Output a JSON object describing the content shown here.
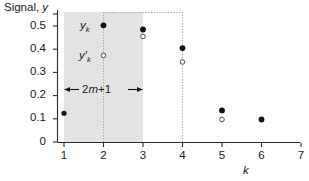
{
  "chart_data": {
    "type": "scatter",
    "title": "",
    "ylabel": "Signal, y",
    "xlabel": "k",
    "xlim": [
      0.45,
      7.35
    ],
    "ylim": [
      0,
      0.565
    ],
    "grid": false,
    "legend_position": "inline-annotation",
    "x": [
      1,
      2,
      3,
      4,
      5,
      6
    ],
    "xticklabels": [
      "1",
      "2",
      "3",
      "4",
      "5",
      "6",
      "7"
    ],
    "xtickvalues": [
      1,
      2,
      3,
      4,
      5,
      6,
      7
    ],
    "yticklabels": [
      "0",
      "0.1",
      "0.2",
      "0.3",
      "0.4",
      "0.5"
    ],
    "ytickvalues": [
      0,
      0.1,
      0.2,
      0.3,
      0.4,
      0.5
    ],
    "series": [
      {
        "name": "y_k",
        "marker": "filled-circle",
        "x": [
          1,
          2,
          3,
          4,
          5,
          6
        ],
        "values": [
          0.124,
          0.503,
          0.485,
          0.405,
          0.136,
          0.097
        ]
      },
      {
        "name": "y'_k",
        "marker": "open-circle",
        "x": [
          2,
          3,
          4,
          5
        ],
        "values": [
          0.373,
          0.455,
          0.345,
          0.097
        ]
      }
    ],
    "shaded_band": {
      "x_start": 1,
      "x_end": 3,
      "color": "#e3e3e3"
    },
    "reference_lines": [
      {
        "orientation": "vertical",
        "x": 2,
        "style": "dotted"
      },
      {
        "orientation": "vertical",
        "x": 4,
        "style": "dotted"
      },
      {
        "orientation": "horizontal",
        "y": 0.553,
        "x_start": 2,
        "x_end": 4,
        "style": "dotted"
      }
    ],
    "annotations": [
      {
        "text": "2m+1",
        "x": 2,
        "y": 0.228,
        "style": "double-headed-arrow",
        "span_x": [
          1,
          3
        ]
      },
      {
        "text": "y_k",
        "x": 1.7,
        "y": 0.503
      },
      {
        "text": "y'_k",
        "x": 1.7,
        "y": 0.373
      }
    ]
  },
  "axes": {
    "y_title_prefix": "Signal, ",
    "y_title_var": "y",
    "x_title": "k",
    "y_ticks": [
      "0.5",
      "0.4",
      "0.3",
      "0.2",
      "0.1",
      "0"
    ],
    "x_ticks": [
      "1",
      "2",
      "3",
      "4",
      "5",
      "6",
      "7"
    ]
  },
  "labels": {
    "series_raw_base": "y",
    "series_raw_sub": "k",
    "series_smooth_base": "y′",
    "series_smooth_sub": "k",
    "window_annotation_a": "2",
    "window_annotation_m": "m",
    "window_annotation_b": "+1"
  },
  "colors": {
    "band": "#e3e3e3",
    "axis": "#2b2b2b",
    "filled_marker": "#111111",
    "open_marker_stroke": "#3a3a3a",
    "dotted_line": "#9a9a9a",
    "text": "#1a1a1a"
  }
}
